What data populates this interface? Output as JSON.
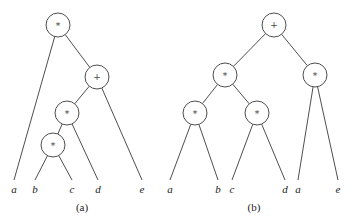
{
  "diagram": {
    "trees": [
      {
        "id": "a",
        "caption": "(a)",
        "nodes": [
          {
            "id": "a_root",
            "label": "*"
          },
          {
            "id": "a_plus",
            "label": "+"
          },
          {
            "id": "a_mul1",
            "label": "*"
          },
          {
            "id": "a_mul2",
            "label": "*"
          }
        ],
        "leaves": [
          {
            "id": "a_la",
            "label": "a"
          },
          {
            "id": "a_lb",
            "label": "b"
          },
          {
            "id": "a_lc",
            "label": "c"
          },
          {
            "id": "a_ld",
            "label": "d"
          },
          {
            "id": "a_le",
            "label": "e"
          }
        ],
        "edges": [
          [
            "a_root",
            "a_la"
          ],
          [
            "a_root",
            "a_plus"
          ],
          [
            "a_plus",
            "a_mul1"
          ],
          [
            "a_plus",
            "a_le"
          ],
          [
            "a_mul1",
            "a_mul2"
          ],
          [
            "a_mul1",
            "a_ld"
          ],
          [
            "a_mul2",
            "a_lb"
          ],
          [
            "a_mul2",
            "a_lc"
          ]
        ]
      },
      {
        "id": "b",
        "caption": "(b)",
        "nodes": [
          {
            "id": "b_root",
            "label": "+"
          },
          {
            "id": "b_mulL",
            "label": "*"
          },
          {
            "id": "b_mulR",
            "label": "*"
          },
          {
            "id": "b_mulLL",
            "label": "*"
          },
          {
            "id": "b_mulLR",
            "label": "*"
          }
        ],
        "leaves": [
          {
            "id": "b_la",
            "label": "a"
          },
          {
            "id": "b_lb",
            "label": "b"
          },
          {
            "id": "b_lc",
            "label": "c"
          },
          {
            "id": "b_ld",
            "label": "d"
          },
          {
            "id": "b_la2",
            "label": "a"
          },
          {
            "id": "b_le",
            "label": "e"
          }
        ],
        "edges": [
          [
            "b_root",
            "b_mulL"
          ],
          [
            "b_root",
            "b_mulR"
          ],
          [
            "b_mulL",
            "b_mulLL"
          ],
          [
            "b_mulL",
            "b_mulLR"
          ],
          [
            "b_mulLL",
            "b_la"
          ],
          [
            "b_mulLL",
            "b_lb"
          ],
          [
            "b_mulLR",
            "b_lc"
          ],
          [
            "b_mulLR",
            "b_ld"
          ],
          [
            "b_mulR",
            "b_la2"
          ],
          [
            "b_mulR",
            "b_le"
          ]
        ]
      }
    ]
  }
}
